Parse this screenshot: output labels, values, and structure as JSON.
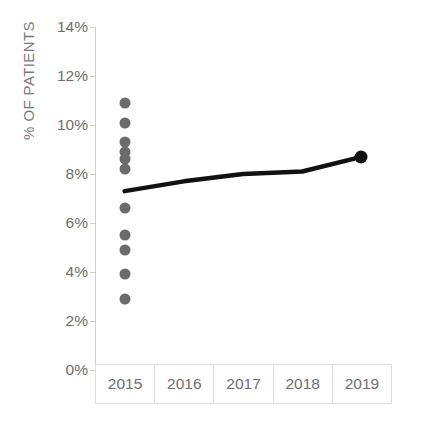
{
  "chart_data": {
    "type": "scatter",
    "title": "",
    "subtitle": "",
    "xlabel": "",
    "ylabel": "% OF PATIENTS",
    "categories": [
      "2015",
      "2016",
      "2017",
      "2018",
      "2019"
    ],
    "x_tick_labels": [
      "2015",
      "2016",
      "2017",
      "2018",
      "2019"
    ],
    "y_tick_labels": [
      "14%",
      "12%",
      "10%",
      "8%",
      "6%",
      "4%",
      "2%",
      "0%"
    ],
    "y_tick_values": [
      14,
      12,
      10,
      8,
      6,
      4,
      2,
      0
    ],
    "ylim": [
      0,
      14
    ],
    "y_unit": "%",
    "grid": false,
    "legend": "none",
    "series": [
      {
        "name": "Individual values 2015",
        "type": "scatter",
        "marker": "circle",
        "color": "#6b6b6b",
        "x": [
          "2015",
          "2015",
          "2015",
          "2015",
          "2015",
          "2015",
          "2015",
          "2015",
          "2015",
          "2015",
          "2015"
        ],
        "values": [
          10.9,
          10.1,
          9.3,
          8.9,
          8.6,
          8.2,
          6.6,
          5.5,
          4.9,
          3.9,
          2.9
        ]
      },
      {
        "name": "Trend",
        "type": "line",
        "color": "#111111",
        "x": [
          "2015",
          "2016",
          "2017",
          "2018",
          "2019"
        ],
        "values": [
          7.3,
          7.7,
          8.0,
          8.1,
          8.7
        ],
        "endpoint_marker": {
          "x": "2019",
          "value": 8.7,
          "color": "#111111"
        }
      }
    ]
  }
}
